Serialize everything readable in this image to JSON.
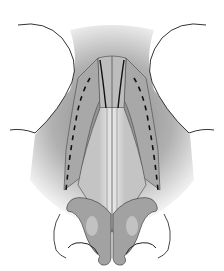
{
  "figure": {
    "colors": {
      "background": "#ffffff",
      "shadow": "#8a8a8a",
      "cartilage": "#b5b5b5",
      "cartilage_light": "#d8d8d8",
      "outline": "#333333",
      "incision": "#111111"
    }
  }
}
